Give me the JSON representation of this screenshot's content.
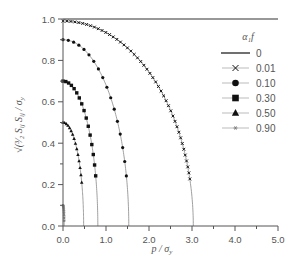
{
  "chart_data": {
    "type": "line",
    "title": "",
    "xlabel": "p / σ_y",
    "ylabel": "√(3/2 S_ij S_ij) / σ_y",
    "xlim": [
      0,
      5
    ],
    "ylim": [
      0,
      1
    ],
    "x_ticks": [
      "0.0",
      "1.0",
      "2.0",
      "3.0",
      "4.0",
      "5.0"
    ],
    "y_ticks": [
      "0.0",
      "0.2",
      "0.4",
      "0.6",
      "0.8",
      "1.0"
    ],
    "grid": false,
    "legend": {
      "title": "α₁f",
      "position": "upper right"
    },
    "series": [
      {
        "name": "0",
        "marker": "none",
        "y0": 1.0,
        "x_end": 5.0,
        "shape": "flat"
      },
      {
        "name": "0.01",
        "marker": "x",
        "y0": 0.99,
        "x_end": 3.03,
        "shape": "ellipse"
      },
      {
        "name": "0.10",
        "marker": "circle",
        "y0": 0.9,
        "x_end": 1.53,
        "shape": "ellipse"
      },
      {
        "name": "0.30",
        "marker": "square",
        "y0": 0.7,
        "x_end": 0.81,
        "shape": "ellipse"
      },
      {
        "name": "0.50",
        "marker": "triangle",
        "y0": 0.5,
        "x_end": 0.48,
        "shape": "ellipse"
      },
      {
        "name": "0.90",
        "marker": "asterisk",
        "y0": 0.1,
        "x_end": 0.03,
        "shape": "ellipse"
      }
    ]
  },
  "colors": {
    "axis": "#555555",
    "line": "#888888",
    "marker": "#111111",
    "text": "#555555"
  }
}
